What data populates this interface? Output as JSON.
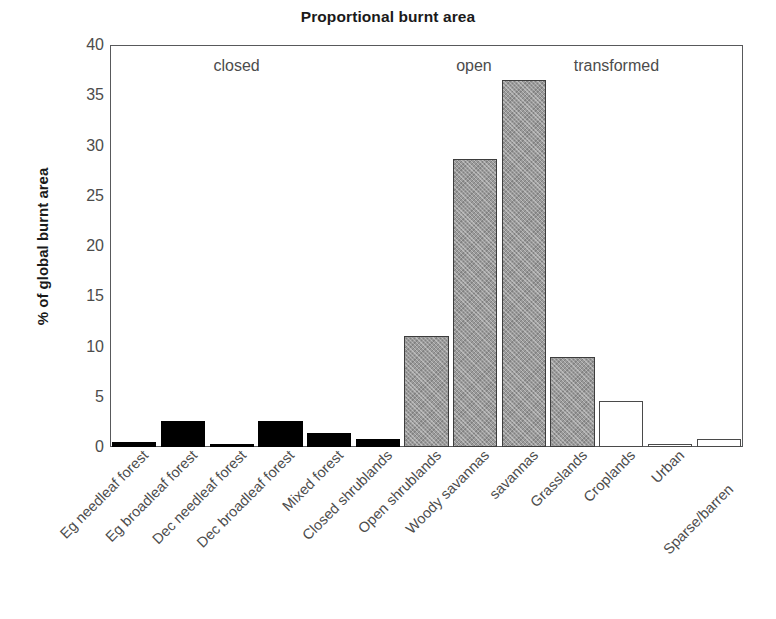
{
  "chart_data": {
    "type": "bar",
    "title": "Proportional burnt area",
    "xlabel": "",
    "ylabel": "% of global burnt area",
    "ylim": [
      0,
      40
    ],
    "yticks": [
      0,
      5,
      10,
      15,
      20,
      25,
      30,
      35,
      40
    ],
    "grid": false,
    "legend": "none",
    "categories": [
      "Eg needleaf forest",
      "Eg broadleaf forest",
      "Dec needleaf forest",
      "Dec broadleaf forest",
      "Mixed forest",
      "Closed shrublands",
      "Open shrublands",
      "Woody savannas",
      "savannas",
      "Grasslands",
      "Croplands",
      "Urban",
      "Sparse/barren"
    ],
    "values": [
      0.5,
      2.6,
      0.25,
      2.6,
      1.4,
      0.75,
      11.0,
      28.7,
      36.5,
      9.0,
      4.6,
      0.15,
      0.8
    ],
    "groups": [
      "closed",
      "closed",
      "closed",
      "closed",
      "closed",
      "closed",
      "open",
      "open",
      "open",
      "open",
      "transformed",
      "transformed",
      "transformed"
    ],
    "annotations": [
      {
        "text": "closed",
        "group": "closed"
      },
      {
        "text": "open",
        "group": "open"
      },
      {
        "text": "transformed",
        "group": "transformed"
      }
    ],
    "colors": {
      "closed": "#000000",
      "open": "#9a9a9a",
      "transformed": "#ffffff",
      "outline": "#4a4a4a",
      "axis": "#58595b",
      "text": "#4c4c4c",
      "title": "#1a1a1a"
    }
  }
}
